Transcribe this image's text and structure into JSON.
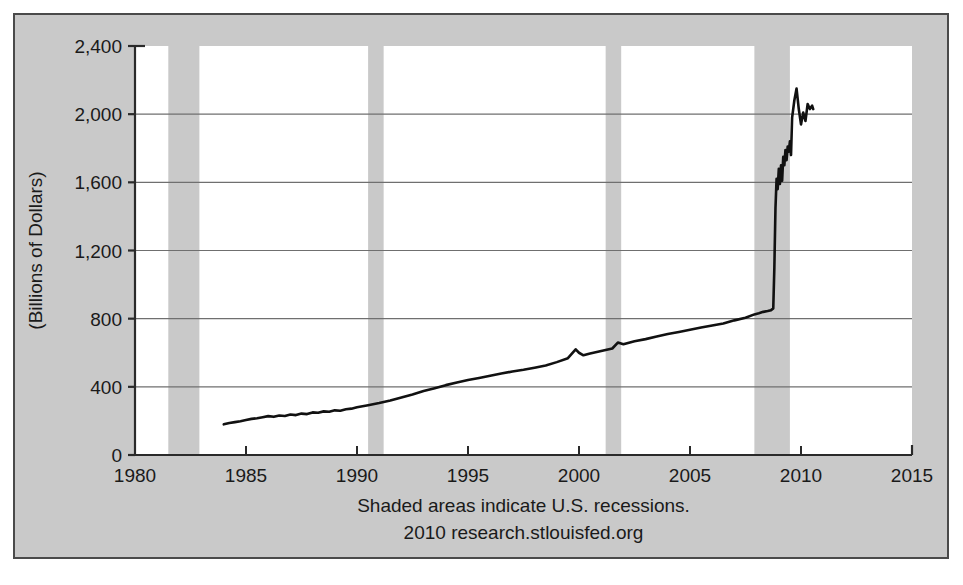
{
  "figure": {
    "background_color": "#c9c9c9",
    "plot_background_color": "#ffffff",
    "border_color": "#4a4a4a",
    "line_color": "#111111",
    "gridline_color": "#6f6f6f",
    "recession_band_color": "#c9c9c9"
  },
  "footer": {
    "line1": "Shaded areas indicate U.S. recessions.",
    "line2": "2010 research.stlouisfed.org"
  },
  "axis": {
    "ylabel": "(Billions of Dollars)",
    "ytick_labels": [
      "0",
      "400",
      "800",
      "1,200",
      "1,600",
      "2,000",
      "2,400"
    ],
    "xtick_labels": [
      "1980",
      "1985",
      "1990",
      "1995",
      "2000",
      "2005",
      "2010",
      "2015"
    ]
  },
  "chart_data": {
    "type": "line",
    "title": "",
    "subtitle": "",
    "xlabel": "",
    "ylabel": "(Billions of Dollars)",
    "xlim": [
      1980,
      2015
    ],
    "ylim": [
      0,
      2400
    ],
    "xticks": [
      1980,
      1985,
      1990,
      1995,
      2000,
      2005,
      2010,
      2015
    ],
    "yticks": [
      0,
      400,
      800,
      1200,
      1600,
      2000,
      2400
    ],
    "xtick_labels": [
      "1980",
      "1985",
      "1990",
      "1995",
      "2000",
      "2005",
      "2010",
      "2015"
    ],
    "ytick_labels": [
      "0",
      "400",
      "800",
      "1,200",
      "1,600",
      "2,000",
      "2,400"
    ],
    "grid": true,
    "grid_axis": "y",
    "legend": false,
    "legend_position": "none",
    "annotations": [
      "Shaded areas indicate U.S. recessions.",
      "2010 research.stlouisfed.org"
    ],
    "shaded_regions": [
      {
        "label": "recession",
        "x0": 1981.5,
        "x1": 1982.9
      },
      {
        "label": "recession",
        "x0": 1990.5,
        "x1": 1991.2
      },
      {
        "label": "recession",
        "x0": 2001.2,
        "x1": 2001.9
      },
      {
        "label": "recession",
        "x0": 2007.9,
        "x1": 2009.5
      }
    ],
    "series": [
      {
        "name": "Monetary Base",
        "color": "#111111",
        "x": [
          1984.0,
          1984.25,
          1984.5,
          1984.75,
          1985.0,
          1985.25,
          1985.5,
          1985.75,
          1986.0,
          1986.25,
          1986.5,
          1986.75,
          1987.0,
          1987.25,
          1987.5,
          1987.75,
          1988.0,
          1988.25,
          1988.5,
          1988.75,
          1989.0,
          1989.25,
          1989.5,
          1989.75,
          1990.0,
          1990.5,
          1991.0,
          1991.5,
          1992.0,
          1992.5,
          1993.0,
          1993.5,
          1994.0,
          1994.5,
          1995.0,
          1995.5,
          1996.0,
          1996.5,
          1997.0,
          1997.5,
          1998.0,
          1998.5,
          1999.0,
          1999.5,
          1999.85,
          2000.0,
          2000.2,
          2000.5,
          2001.0,
          2001.5,
          2001.75,
          2002.0,
          2002.5,
          2003.0,
          2003.5,
          2004.0,
          2004.5,
          2005.0,
          2005.5,
          2006.0,
          2006.5,
          2007.0,
          2007.5,
          2007.9,
          2008.1,
          2008.3,
          2008.5,
          2008.65,
          2008.75,
          2008.8,
          2008.85,
          2008.9,
          2008.95,
          2009.0,
          2009.05,
          2009.1,
          2009.15,
          2009.2,
          2009.25,
          2009.3,
          2009.35,
          2009.4,
          2009.45,
          2009.5,
          2009.55,
          2009.6,
          2009.7,
          2009.8,
          2009.9,
          2010.0,
          2010.1,
          2010.2,
          2010.3,
          2010.4,
          2010.5,
          2010.55
        ],
        "y": [
          180,
          188,
          193,
          198,
          205,
          212,
          216,
          222,
          228,
          224,
          232,
          229,
          238,
          234,
          243,
          240,
          250,
          248,
          256,
          254,
          262,
          260,
          268,
          272,
          280,
          292,
          305,
          320,
          338,
          355,
          375,
          392,
          410,
          425,
          440,
          452,
          465,
          478,
          490,
          500,
          512,
          525,
          545,
          568,
          620,
          600,
          585,
          595,
          610,
          625,
          660,
          650,
          668,
          680,
          695,
          710,
          722,
          735,
          748,
          760,
          772,
          790,
          805,
          825,
          832,
          840,
          845,
          850,
          860,
          1100,
          1450,
          1620,
          1560,
          1680,
          1590,
          1700,
          1610,
          1750,
          1700,
          1790,
          1730,
          1810,
          1780,
          1840,
          1760,
          1980,
          2080,
          2150,
          2030,
          1940,
          2010,
          1960,
          2060,
          2030,
          2050,
          2030
        ]
      }
    ]
  }
}
